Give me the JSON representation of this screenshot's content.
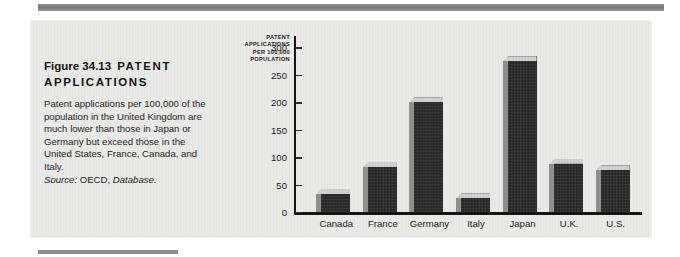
{
  "figure": {
    "title_number": "Figure 34.13",
    "title_word1": "PATENT",
    "title_word2": "APPLICATIONS",
    "body_text": "Patent applications per 100,000 of the population in the United Kingdom are much lower than those in Japan or Germany but exceed those in the United States, France, Canada, and Italy.",
    "source_label": "Source:",
    "source_org": "OECD,",
    "source_publication": "Database."
  },
  "colors": {
    "panel_background": "#e9e9e7",
    "page_background": "#ffffff",
    "rule": "#8d8d8d",
    "bar_face": "#262626",
    "bar_side": "#8e8e8e",
    "bar_top": "#cfcfcf",
    "axis": "#121212",
    "text": "#1a1a1a"
  },
  "chart_data": {
    "type": "bar",
    "title": "",
    "xlabel": "",
    "ylabel": "PATENT APPLICATIONS PER 100,000 POPULATION",
    "ylabel_lines": [
      "PATENT",
      "APPLICATIONS",
      "PER 100,000",
      "POPULATION"
    ],
    "categories": [
      "Canada",
      "France",
      "Germany",
      "Italy",
      "Japan",
      "U.K.",
      "U.S."
    ],
    "values": [
      33,
      82,
      200,
      25,
      275,
      88,
      76
    ],
    "ylim": [
      0,
      310
    ],
    "yticks": [
      0,
      50,
      100,
      150,
      200,
      250,
      300
    ],
    "ytick_labels": [
      "0",
      "50",
      "100",
      "150",
      "200",
      "250",
      "300"
    ],
    "grid": false,
    "legend": false,
    "style_3d": true
  }
}
